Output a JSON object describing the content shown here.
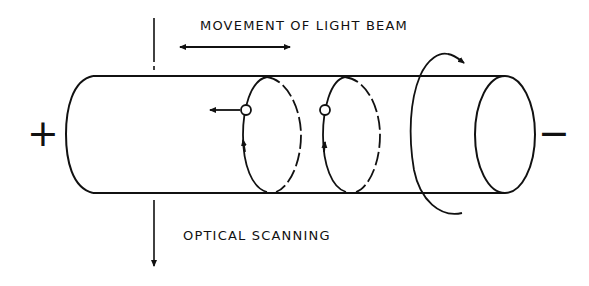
{
  "diagram": {
    "labels": {
      "movement": "MOVEMENT OF LIGHT BEAM",
      "scanning": "OPTICAL SCANNING"
    },
    "signs": {
      "positive": "+",
      "negative": "−"
    },
    "colors": {
      "ink": "#111111",
      "background": "#ffffff"
    },
    "elements": [
      "cylinder",
      "scan-ring-1",
      "scan-ring-2",
      "light-beam-marker-1",
      "light-beam-marker-2",
      "rotation-arrow",
      "movement-double-arrow",
      "optical-scanning-axis-arrow"
    ]
  }
}
